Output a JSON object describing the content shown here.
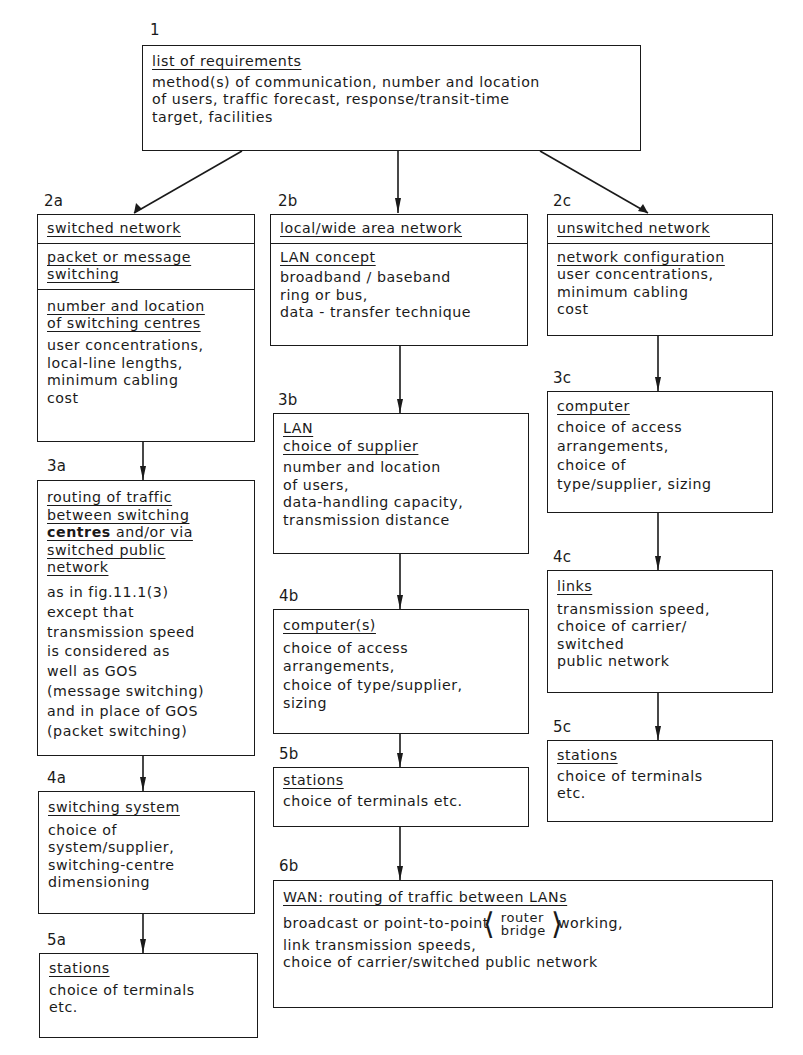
{
  "nodes": {
    "n1": {
      "number": "1",
      "title": "list of requirements",
      "body": "method(s) of communication, number and location\nof users, traffic forecast, response/transit-time\ntarget, facilities"
    },
    "n2a": {
      "number": "2a",
      "title": "switched network",
      "sub1": "packet or message\nswitching",
      "sub2_title": "number and location\nof switching centres",
      "sub2_body": "user concentrations,\nlocal-line lengths,\nminimum cabling\ncost"
    },
    "n2b": {
      "number": "2b",
      "title": "local/wide area network",
      "sub_title": "LAN concept",
      "sub_body": "broadband / baseband\nring or bus,\ndata - transfer technique"
    },
    "n2c": {
      "number": "2c",
      "title": "unswitched network",
      "sub_title": "network configuration",
      "sub_body": "user concentrations,\nminimum cabling\ncost"
    },
    "n3a": {
      "number": "3a",
      "title_part1": "routing of traffic\nbetween switching\n",
      "title_bold": "centres",
      "title_part2": " and/or via\nswitched public\nnetwork",
      "body": "as in fig.11.1(3)\nexcept that\ntransmission speed\nis considered as\nwell as GOS\n(message switching)\nand in place of GOS\n(packet switching)"
    },
    "n3b": {
      "number": "3b",
      "title": "LAN\nchoice of supplier",
      "body": "number and location\nof users,\ndata-handling capacity,\ntransmission distance"
    },
    "n3c": {
      "number": "3c",
      "title": "computer",
      "body": "choice of access\narrangements,\nchoice of\ntype/supplier, sizing"
    },
    "n4a": {
      "number": "4a",
      "title": "switching system",
      "body": "choice of\nsystem/supplier,\nswitching-centre\ndimensioning"
    },
    "n4b": {
      "number": "4b",
      "title": "computer(s)",
      "body": "choice of access\narrangements,\nchoice of type/supplier,\nsizing"
    },
    "n4c": {
      "number": "4c",
      "title": "links",
      "body": "transmission speed,\nchoice of carrier/\nswitched\npublic network"
    },
    "n5a": {
      "number": "5a",
      "title": "stations",
      "body": "choice of terminals\netc."
    },
    "n5b": {
      "number": "5b",
      "title": "stations",
      "body": "choice of terminals etc."
    },
    "n5c": {
      "number": "5c",
      "title": "stations",
      "body": "choice of terminals\netc."
    },
    "n6b": {
      "number": "6b",
      "title": "WAN: routing of traffic between LANs",
      "line1_pre": "broadcast or point-to-point",
      "bracket_top": "router",
      "bracket_bottom": "bridge",
      "line1_post": "working,",
      "body": "link transmission speeds,\nchoice of carrier/switched public network"
    }
  },
  "edges": [
    [
      "n1",
      "n2a"
    ],
    [
      "n1",
      "n2b"
    ],
    [
      "n1",
      "n2c"
    ],
    [
      "n2a",
      "n3a"
    ],
    [
      "n3a",
      "n4a"
    ],
    [
      "n4a",
      "n5a"
    ],
    [
      "n2b",
      "n3b"
    ],
    [
      "n3b",
      "n4b"
    ],
    [
      "n4b",
      "n5b"
    ],
    [
      "n5b",
      "n6b"
    ],
    [
      "n2c",
      "n3c"
    ],
    [
      "n3c",
      "n4c"
    ],
    [
      "n4c",
      "n5c"
    ]
  ],
  "colors": {
    "line": "#1a1a1a",
    "background": "#ffffff"
  }
}
